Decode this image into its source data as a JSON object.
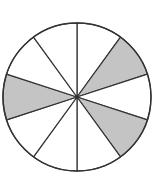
{
  "diagram": {
    "type": "fraction-circle",
    "center": [
      77,
      97
    ],
    "radius": 74,
    "total_slices": 10,
    "shaded_slices": [
      1,
      3,
      7
    ],
    "shaded_count": 3,
    "fraction": "3/10",
    "colors": {
      "shade": "#c4c4c4",
      "background": "#ffffff",
      "stroke": "#333333"
    }
  }
}
